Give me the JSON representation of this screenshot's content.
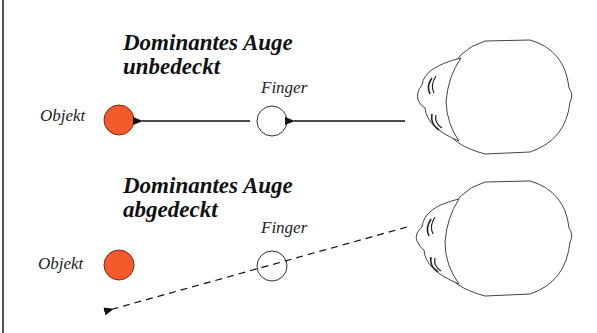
{
  "panels": [
    {
      "title_line1": "Dominantes Auge",
      "title_line2": "unbedeckt",
      "object_label": "Objekt",
      "finger_label": "Finger",
      "sight_line": "solid"
    },
    {
      "title_line1": "Dominantes Auge",
      "title_line2": "abgedeckt",
      "object_label": "Objekt",
      "finger_label": "Finger",
      "sight_line": "dashed"
    }
  ],
  "colors": {
    "object_fill": "#F55A2A",
    "object_stroke": "#7a2a10",
    "line": "#111111",
    "head_stroke": "#444444"
  }
}
